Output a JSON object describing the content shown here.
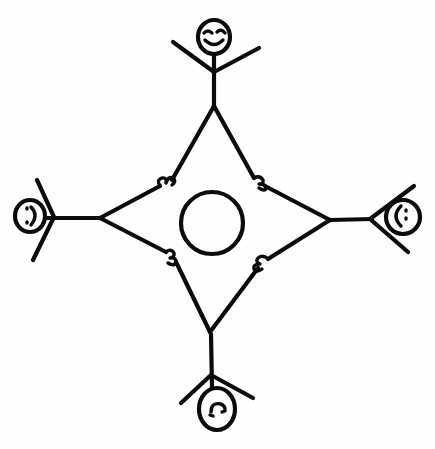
{
  "illustration": {
    "description": "Hand-drawn stick figure drawing: four stick figures holding hands around a central circle, forming a four-pointed star shape",
    "style": "black ink line drawing on white background",
    "ink_color": "#0b0b0b",
    "background_color": "#fefefe",
    "figures": [
      {
        "position": "top",
        "expression": "smiling",
        "orientation": "upright"
      },
      {
        "position": "right",
        "expression": "smiling",
        "orientation": "rotated"
      },
      {
        "position": "bottom",
        "expression": "smiling",
        "orientation": "upside-down"
      },
      {
        "position": "left",
        "expression": "smiling",
        "orientation": "rotated"
      }
    ],
    "center_shape": "circle",
    "hand_joins": 4
  }
}
